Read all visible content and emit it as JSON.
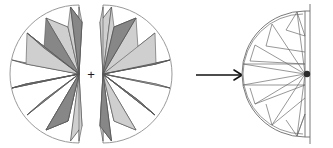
{
  "figure": {
    "type": "geometric-diagram",
    "background_color": "#ffffff",
    "operator_label": "+",
    "arrow_label": "",
    "colors": {
      "outline": "#4a4a4a",
      "circle_stroke": "#8a8a8a",
      "ray_dark": "#878787",
      "ray_light": "#cfcfcf",
      "ray_stroke": "#5a5a5a",
      "result_stroke": "#6b6b6b",
      "hub_color": "#2b2b2b",
      "arrow_color": "#111111",
      "plus_color": "#1a1a1a"
    },
    "panels": [
      {
        "name": "left-half-disk",
        "orientation": "left",
        "center_x": 79,
        "center_y": 74,
        "radius": 69,
        "ray_count": 8,
        "ray_angles_deg": [
          100,
          122,
          145,
          168,
          192,
          215,
          238,
          260
        ],
        "ray_shades": [
          "dark",
          "light",
          "dark",
          "light",
          "dark",
          "light",
          "dark",
          "light"
        ]
      },
      {
        "name": "right-half-disk",
        "orientation": "right",
        "center_x": 103,
        "center_y": 74,
        "radius": 69,
        "ray_count": 8,
        "ray_angles_deg": [
          80,
          58,
          35,
          12,
          -12,
          -35,
          -58,
          -80
        ],
        "ray_shades": [
          "light",
          "dark",
          "light",
          "dark",
          "light",
          "dark",
          "light",
          "dark"
        ]
      },
      {
        "name": "result-half-disk",
        "orientation": "left",
        "center_x": 305,
        "center_y": 74,
        "radius": 63,
        "ray_count": 8,
        "filled": false,
        "hub_marker": true,
        "axis_line": true
      }
    ],
    "arrow": {
      "name": "transform-arrow",
      "x_start": 196,
      "x_end": 243,
      "y": 75,
      "head_size": 7
    }
  }
}
